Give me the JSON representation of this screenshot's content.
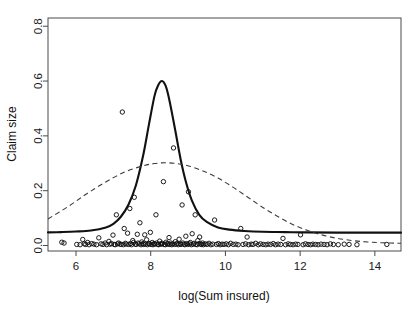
{
  "chart_data": {
    "type": "scatter",
    "title": "",
    "xlabel": "log(Sum insured)",
    "ylabel": "Claim size",
    "xlim": [
      5.25,
      14.7
    ],
    "ylim": [
      -0.02,
      0.83
    ],
    "xticks": [
      6,
      8,
      10,
      12,
      14
    ],
    "xtick_labels": [
      "6",
      "8",
      "10",
      "12",
      "14"
    ],
    "yticks": [
      0.0,
      0.2,
      0.4,
      0.6,
      0.8
    ],
    "ytick_labels": [
      "0.0",
      "0.2",
      "0.4",
      "0.6",
      "0.8"
    ],
    "grid": false,
    "legend": "none",
    "frame": "box",
    "colors": {
      "solid_curve": "#111111",
      "dashed_curve": "#3c3c3c",
      "points": "#111111",
      "axis": "#4a4a4a",
      "background": "#ffffff"
    },
    "series": [
      {
        "name": "observations",
        "type": "scatter",
        "marker": "open-circle",
        "points": [
          [
            5.62,
            0.012
          ],
          [
            5.68,
            0.009
          ],
          [
            6.02,
            0.004
          ],
          [
            6.11,
            0.003
          ],
          [
            6.18,
            0.022
          ],
          [
            6.22,
            0.006
          ],
          [
            6.26,
            0.004
          ],
          [
            6.31,
            0.011
          ],
          [
            6.35,
            0.003
          ],
          [
            6.42,
            0.007
          ],
          [
            6.48,
            0.005
          ],
          [
            6.55,
            0.003
          ],
          [
            6.61,
            0.028
          ],
          [
            6.67,
            0.006
          ],
          [
            6.72,
            0.004
          ],
          [
            6.78,
            0.009
          ],
          [
            6.82,
            0.003
          ],
          [
            6.88,
            0.015
          ],
          [
            6.91,
            0.005
          ],
          [
            6.95,
            0.007
          ],
          [
            6.99,
            0.038
          ],
          [
            7.02,
            0.004
          ],
          [
            7.05,
            0.003
          ],
          [
            7.08,
            0.112
          ],
          [
            7.11,
            0.006
          ],
          [
            7.14,
            0.009
          ],
          [
            7.18,
            0.005
          ],
          [
            7.21,
            0.004
          ],
          [
            7.24,
            0.487
          ],
          [
            7.27,
            0.003
          ],
          [
            7.29,
            0.062
          ],
          [
            7.32,
            0.008
          ],
          [
            7.35,
            0.005
          ],
          [
            7.38,
            0.045
          ],
          [
            7.41,
            0.004
          ],
          [
            7.44,
            0.135
          ],
          [
            7.46,
            0.007
          ],
          [
            7.49,
            0.003
          ],
          [
            7.52,
            0.018
          ],
          [
            7.54,
            0.011
          ],
          [
            7.56,
            0.176
          ],
          [
            7.59,
            0.005
          ],
          [
            7.61,
            0.004
          ],
          [
            7.64,
            0.041
          ],
          [
            7.66,
            0.009
          ],
          [
            7.69,
            0.006
          ],
          [
            7.71,
            0.083
          ],
          [
            7.74,
            0.003
          ],
          [
            7.76,
            0.013
          ],
          [
            7.79,
            0.007
          ],
          [
            7.81,
            0.004
          ],
          [
            7.84,
            0.039
          ],
          [
            7.86,
            0.005
          ],
          [
            7.89,
            0.021
          ],
          [
            7.91,
            0.003
          ],
          [
            7.94,
            0.008
          ],
          [
            7.96,
            0.006
          ],
          [
            7.99,
            0.048
          ],
          [
            8.01,
            0.004
          ],
          [
            8.04,
            0.011
          ],
          [
            8.06,
            0.003
          ],
          [
            8.09,
            0.007
          ],
          [
            8.11,
            0.005
          ],
          [
            8.14,
            0.112
          ],
          [
            8.16,
            0.009
          ],
          [
            8.19,
            0.004
          ],
          [
            8.21,
            0.003
          ],
          [
            8.24,
            0.016
          ],
          [
            8.26,
            0.006
          ],
          [
            8.29,
            0.005
          ],
          [
            8.31,
            0.008
          ],
          [
            8.34,
            0.233
          ],
          [
            8.36,
            0.004
          ],
          [
            8.39,
            0.003
          ],
          [
            8.41,
            0.012
          ],
          [
            8.44,
            0.007
          ],
          [
            8.46,
            0.005
          ],
          [
            8.49,
            0.029
          ],
          [
            8.51,
            0.004
          ],
          [
            8.54,
            0.009
          ],
          [
            8.56,
            0.003
          ],
          [
            8.59,
            0.006
          ],
          [
            8.61,
            0.356
          ],
          [
            8.64,
            0.004
          ],
          [
            8.66,
            0.014
          ],
          [
            8.69,
            0.005
          ],
          [
            8.71,
            0.008
          ],
          [
            8.74,
            0.003
          ],
          [
            8.76,
            0.023
          ],
          [
            8.79,
            0.006
          ],
          [
            8.81,
            0.004
          ],
          [
            8.84,
            0.148
          ],
          [
            8.86,
            0.009
          ],
          [
            8.89,
            0.005
          ],
          [
            8.91,
            0.003
          ],
          [
            8.94,
            0.034
          ],
          [
            8.96,
            0.007
          ],
          [
            8.99,
            0.004
          ],
          [
            9.01,
            0.196
          ],
          [
            9.04,
            0.006
          ],
          [
            9.06,
            0.011
          ],
          [
            9.09,
            0.003
          ],
          [
            9.11,
            0.043
          ],
          [
            9.14,
            0.005
          ],
          [
            9.16,
            0.008
          ],
          [
            9.19,
            0.112
          ],
          [
            9.21,
            0.004
          ],
          [
            9.24,
            0.003
          ],
          [
            9.26,
            0.018
          ],
          [
            9.29,
            0.007
          ],
          [
            9.31,
            0.031
          ],
          [
            9.34,
            0.005
          ],
          [
            9.36,
            0.004
          ],
          [
            9.39,
            0.009
          ],
          [
            9.41,
            0.003
          ],
          [
            9.46,
            0.006
          ],
          [
            9.51,
            0.004
          ],
          [
            9.56,
            0.008
          ],
          [
            9.61,
            0.003
          ],
          [
            9.66,
            0.005
          ],
          [
            9.71,
            0.093
          ],
          [
            9.76,
            0.004
          ],
          [
            9.81,
            0.007
          ],
          [
            9.86,
            0.003
          ],
          [
            9.91,
            0.005
          ],
          [
            9.96,
            0.004
          ],
          [
            10.02,
            0.006
          ],
          [
            10.08,
            0.003
          ],
          [
            10.14,
            0.008
          ],
          [
            10.21,
            0.004
          ],
          [
            10.28,
            0.005
          ],
          [
            10.34,
            0.003
          ],
          [
            10.41,
            0.062
          ],
          [
            10.47,
            0.004
          ],
          [
            10.54,
            0.006
          ],
          [
            10.58,
            0.031
          ],
          [
            10.62,
            0.003
          ],
          [
            10.69,
            0.005
          ],
          [
            10.74,
            0.004
          ],
          [
            10.81,
            0.008
          ],
          [
            10.88,
            0.003
          ],
          [
            10.94,
            0.006
          ],
          [
            11.01,
            0.004
          ],
          [
            11.08,
            0.003
          ],
          [
            11.14,
            0.005
          ],
          [
            11.21,
            0.004
          ],
          [
            11.28,
            0.007
          ],
          [
            11.34,
            0.003
          ],
          [
            11.41,
            0.005
          ],
          [
            11.48,
            0.004
          ],
          [
            11.54,
            0.026
          ],
          [
            11.61,
            0.003
          ],
          [
            11.68,
            0.006
          ],
          [
            11.74,
            0.004
          ],
          [
            11.81,
            0.003
          ],
          [
            11.88,
            0.005
          ],
          [
            11.94,
            0.004
          ],
          [
            12.01,
            0.039
          ],
          [
            12.08,
            0.003
          ],
          [
            12.14,
            0.006
          ],
          [
            12.21,
            0.004
          ],
          [
            12.28,
            0.003
          ],
          [
            12.34,
            0.005
          ],
          [
            12.41,
            0.004
          ],
          [
            12.48,
            0.003
          ],
          [
            12.56,
            0.005
          ],
          [
            12.64,
            0.004
          ],
          [
            12.72,
            0.003
          ],
          [
            12.81,
            0.006
          ],
          [
            12.89,
            0.004
          ],
          [
            13.02,
            0.003
          ],
          [
            13.18,
            0.005
          ],
          [
            13.31,
            0.004
          ],
          [
            13.52,
            0.003
          ],
          [
            14.32,
            0.004
          ]
        ]
      },
      {
        "name": "fitted-density-solid",
        "type": "line",
        "style": "solid",
        "description": "narrow peaked curve centred near 8.3",
        "x": [
          5.25,
          5.6,
          6.0,
          6.4,
          6.8,
          7.0,
          7.2,
          7.4,
          7.6,
          7.8,
          7.95,
          8.1,
          8.2,
          8.3,
          8.4,
          8.5,
          8.65,
          8.8,
          8.95,
          9.1,
          9.3,
          9.5,
          9.8,
          10.1,
          10.5,
          11.0,
          11.6,
          12.2,
          13.0,
          14.0,
          14.7
        ],
        "y": [
          0.048,
          0.049,
          0.051,
          0.055,
          0.066,
          0.079,
          0.105,
          0.148,
          0.218,
          0.33,
          0.44,
          0.545,
          0.585,
          0.6,
          0.582,
          0.53,
          0.425,
          0.315,
          0.228,
          0.165,
          0.112,
          0.086,
          0.066,
          0.058,
          0.053,
          0.05,
          0.049,
          0.048,
          0.047,
          0.047,
          0.047
        ]
      },
      {
        "name": "fitted-density-dashed",
        "type": "line",
        "style": "dashed",
        "description": "broad flat curve peaking near 8.4",
        "x": [
          5.25,
          5.8,
          6.3,
          6.8,
          7.3,
          7.8,
          8.1,
          8.4,
          8.7,
          9.0,
          9.4,
          9.8,
          10.2,
          10.6,
          11.0,
          11.4,
          11.8,
          12.2,
          12.6,
          13.0,
          13.4,
          13.8,
          14.2,
          14.7
        ],
        "y": [
          0.097,
          0.143,
          0.19,
          0.232,
          0.268,
          0.291,
          0.299,
          0.302,
          0.299,
          0.291,
          0.272,
          0.246,
          0.213,
          0.176,
          0.139,
          0.106,
          0.077,
          0.055,
          0.038,
          0.026,
          0.018,
          0.013,
          0.01,
          0.008
        ]
      }
    ]
  }
}
